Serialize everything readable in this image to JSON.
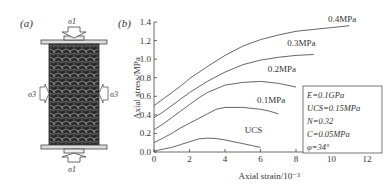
{
  "panel_a": {
    "label": "(a)",
    "title": "Triaxial specimen schematic",
    "sigma1_top": "σ1",
    "sigma1_bottom": "σ1",
    "sigma3_left": "σ3",
    "sigma3_right": "σ3"
  },
  "panel_b": {
    "label": "(b)",
    "params_box": {
      "lines": [
        "E=0.1GPa",
        "UCS=0.15MPa",
        "N=0.32",
        "C=0.05MPa",
        "φ=34°"
      ]
    }
  },
  "chart_data": {
    "type": "line",
    "title": "",
    "xlabel": "Axial strain/10⁻³",
    "ylabel": "Axial stress/MPa",
    "xlim": [
      0,
      12
    ],
    "ylim": [
      0,
      1.4
    ],
    "xticks": [
      0,
      2,
      4,
      6,
      8,
      10,
      12
    ],
    "yticks": [
      0.0,
      0.2,
      0.4,
      0.6,
      0.8,
      1.0,
      1.2,
      1.4
    ],
    "ytick_labels": [
      "0.0",
      "0.2",
      "0.4",
      "0.6",
      "0.8",
      "1.0",
      "1.2",
      "1.4"
    ],
    "grid": false,
    "legend_position": "inline labels",
    "series": [
      {
        "name": "UCS",
        "label_pos": [
          5.6,
          0.2
        ],
        "x": [
          0,
          0.5,
          1,
          1.5,
          2,
          2.5,
          3,
          3.5,
          4,
          4.5,
          5,
          5.5,
          6
        ],
        "y": [
          0.01,
          0.03,
          0.05,
          0.08,
          0.11,
          0.14,
          0.15,
          0.145,
          0.13,
          0.11,
          0.09,
          0.07,
          0.05
        ]
      },
      {
        "name": "0.1MPa",
        "label_pos": [
          6.6,
          0.53
        ],
        "x": [
          0,
          0.5,
          1,
          1.5,
          2,
          2.5,
          3,
          3.5,
          4,
          5,
          6,
          6.5,
          7
        ],
        "y": [
          0.1,
          0.15,
          0.2,
          0.26,
          0.31,
          0.36,
          0.41,
          0.46,
          0.48,
          0.48,
          0.46,
          0.44,
          0.41
        ]
      },
      {
        "name": "0.2MPa",
        "label_pos": [
          7.2,
          0.86
        ],
        "x": [
          0,
          0.5,
          1,
          1.5,
          2,
          2.5,
          3,
          4,
          5,
          6,
          7,
          8
        ],
        "y": [
          0.24,
          0.3,
          0.37,
          0.44,
          0.51,
          0.58,
          0.64,
          0.72,
          0.75,
          0.76,
          0.74,
          0.7
        ]
      },
      {
        "name": "0.3MPa",
        "label_pos": [
          8.3,
          1.14
        ],
        "x": [
          0,
          0.5,
          1,
          1.5,
          2,
          3,
          4,
          5,
          6,
          7,
          8,
          9
        ],
        "y": [
          0.37,
          0.43,
          0.5,
          0.57,
          0.64,
          0.76,
          0.86,
          0.94,
          0.99,
          1.02,
          1.04,
          1.05
        ]
      },
      {
        "name": "0.4MPa",
        "label_pos": [
          10.6,
          1.4
        ],
        "x": [
          0,
          0.5,
          1,
          1.5,
          2,
          3,
          4,
          5,
          6,
          7,
          8,
          9,
          10,
          11
        ],
        "y": [
          0.5,
          0.57,
          0.64,
          0.71,
          0.79,
          0.92,
          1.04,
          1.14,
          1.21,
          1.26,
          1.3,
          1.32,
          1.34,
          1.36
        ]
      }
    ]
  }
}
